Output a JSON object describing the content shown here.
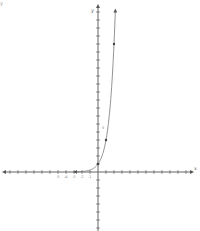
{
  "figure": {
    "corner_label": "y",
    "x_axis_label": "x",
    "y_axis_label": "y",
    "y_tick_label": "5",
    "neg_x_tick_labels": [
      "-5",
      "-4",
      "-3",
      "-2",
      "-1"
    ],
    "colors": {
      "axis": "#555555",
      "curve": "#777777",
      "point": "#444444",
      "background": "#ffffff"
    }
  },
  "chart_data": {
    "type": "line",
    "title": "",
    "xlabel": "x",
    "ylabel": "y",
    "function": "y = 4^x",
    "xlim": [
      -12,
      12
    ],
    "ylim": [
      -7,
      21
    ],
    "grid": false,
    "legend": null,
    "x_ticks_step": 1,
    "y_ticks_step": 1,
    "series": [
      {
        "name": "exponential curve",
        "x": [
          -3,
          -2,
          -1,
          0,
          0.5,
          1,
          1.5,
          2,
          2.2
        ],
        "y": [
          0.016,
          0.0625,
          0.25,
          1,
          2,
          4,
          8,
          16,
          21
        ]
      }
    ],
    "marked_points": [
      {
        "x": 0,
        "y": 1
      },
      {
        "x": 1,
        "y": 4
      },
      {
        "x": 2,
        "y": 16
      }
    ],
    "annotations": [
      {
        "text": "5",
        "x": 0.6,
        "y": 5
      }
    ],
    "arrows": [
      "left-end of curve approaching y=0",
      "top-end of curve"
    ]
  }
}
